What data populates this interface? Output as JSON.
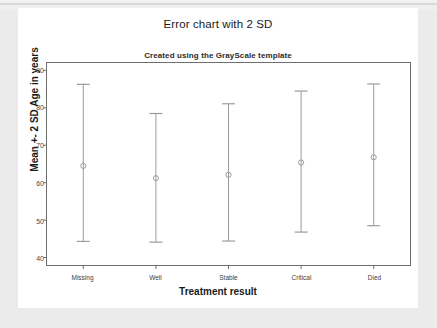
{
  "chart_data": {
    "type": "scatter",
    "title": "Error chart with 2 SD",
    "subtitle": "Created using the GrayScale template",
    "xlabel": "Treatment result",
    "ylabel": "Mean +- 2 SD Age in years",
    "categories": [
      "Missing",
      "Well",
      "Stable",
      "Critical",
      "Died"
    ],
    "ylim": [
      38,
      92
    ],
    "yticks": [
      40,
      50,
      60,
      70,
      80,
      90
    ],
    "ytick_labels": [
      "40",
      "50",
      "60",
      "70",
      "80",
      "90"
    ],
    "grid": false,
    "legend": "none",
    "series": [
      {
        "name": "Mean +- 2 SD Age in years",
        "means": [
          64.5,
          61.2,
          62.1,
          65.4,
          66.8
        ],
        "upper": [
          86.3,
          78.5,
          81.1,
          84.5,
          86.4
        ],
        "lower": [
          44.3,
          44.1,
          44.4,
          46.8,
          48.5
        ]
      }
    ],
    "marker": "open-circle",
    "error_bar_color": "#9a9a9a",
    "axis_color": "#6e6e6e",
    "text_color": "#1a1a1a",
    "background_color": "#ffffff"
  },
  "card": {
    "title": "Error chart with 2 SD",
    "subtitle": "Created using the GrayScale template"
  }
}
